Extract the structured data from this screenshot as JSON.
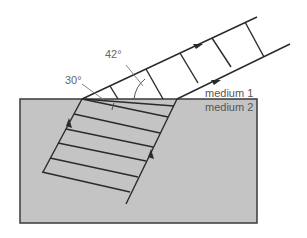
{
  "diagram": {
    "labels": {
      "angle_incident": "30°",
      "angle_refracted": "42°",
      "medium_top": "medium 1",
      "medium_bottom": "medium 2"
    },
    "colors": {
      "medium2_fill": "#c4c4c4",
      "line": "#2a2a2a",
      "label_text": "#666666",
      "background": "#ffffff"
    },
    "elements": {
      "incident_rays": 2,
      "refracted_rays": 2,
      "wavefronts_medium2": 6,
      "wavefronts_medium1": 4
    }
  }
}
